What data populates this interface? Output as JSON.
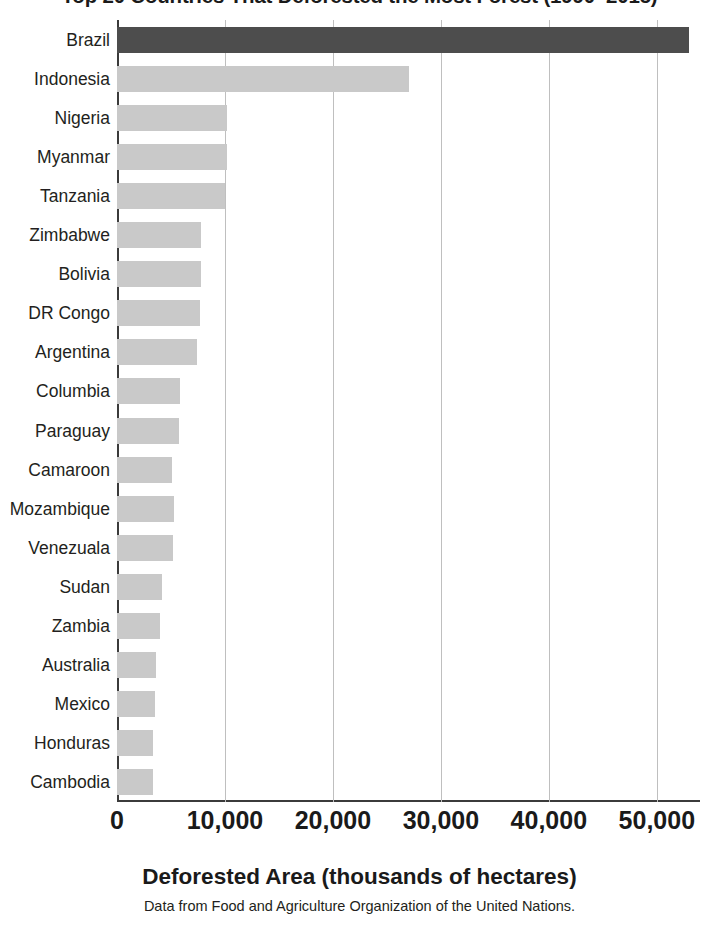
{
  "chart_data": {
    "type": "bar",
    "orientation": "horizontal",
    "title": "Top 20 Countries That Deforested the Most Forest (1990–2015)",
    "xlabel": "Deforested Area (thousands of hectares)",
    "ylabel": "",
    "source_note": "Data from Food and Agriculture Organization of the United Nations.",
    "categories": [
      "Brazil",
      "Indonesia",
      "Nigeria",
      "Myanmar",
      "Tanzania",
      "Zimbabwe",
      "Bolivia",
      "DR Congo",
      "Argentina",
      "Columbia",
      "Paraguay",
      "Camaroon",
      "Mozambique",
      "Venezuala",
      "Sudan",
      "Zambia",
      "Australia",
      "Mexico",
      "Honduras",
      "Cambodia"
    ],
    "values": [
      53000,
      27000,
      10200,
      10200,
      10000,
      7800,
      7800,
      7700,
      7400,
      5800,
      5700,
      5100,
      5300,
      5200,
      4200,
      4000,
      3600,
      3500,
      3300,
      3300
    ],
    "highlight_index": 0,
    "xlim": [
      0,
      54000
    ],
    "xticks": [
      0,
      10000,
      20000,
      30000,
      40000,
      50000
    ],
    "xticklabels": [
      "0",
      "10,000",
      "20,000",
      "30,000",
      "40,000",
      "50,000"
    ],
    "grid": "vertical",
    "legend": "none",
    "colors": {
      "bar": "#c9c9c9",
      "bar_highlight": "#4d4d4d",
      "axis": "#3b3b3b",
      "gridline": "#bfbfbf",
      "text": "#231f20"
    }
  }
}
